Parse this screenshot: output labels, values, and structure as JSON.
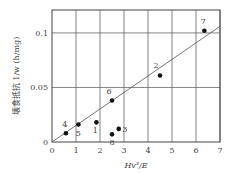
{
  "chart_data": {
    "type": "scatter",
    "title": "",
    "xlabel": "Hv³/E",
    "ylabel": "壊食抵抗  1/w (h/mg)",
    "xlim": [
      0,
      7
    ],
    "ylim": [
      0,
      0.121
    ],
    "x_ticks": [
      "0",
      "1",
      "2",
      "3",
      "4",
      "5",
      "6",
      "7"
    ],
    "y_ticks": [
      {
        "value": 0,
        "label": "0"
      },
      {
        "value": 0.05,
        "label": "0.05"
      },
      {
        "value": 0.1,
        "label": "0.1"
      }
    ],
    "grid": true,
    "points": [
      {
        "label": "1",
        "x": 1.85,
        "y": 0.018
      },
      {
        "label": "2",
        "x": 4.5,
        "y": 0.061
      },
      {
        "label": "3",
        "x": 2.78,
        "y": 0.012
      },
      {
        "label": "4",
        "x": 0.58,
        "y": 0.008
      },
      {
        "label": "5",
        "x": 1.1,
        "y": 0.016
      },
      {
        "label": "6",
        "x": 2.5,
        "y": 0.038
      },
      {
        "label": "7",
        "x": 6.35,
        "y": 0.102
      },
      {
        "label": "8",
        "x": 2.5,
        "y": 0.007
      }
    ],
    "fit_line": {
      "x": [
        0,
        7
      ],
      "y": [
        0,
        0.106
      ]
    },
    "point_label_offsets": {
      "1": [
        -1,
        11
      ],
      "2": [
        -4,
        -7
      ],
      "3": [
        6,
        3
      ],
      "4": [
        -1,
        -6
      ],
      "5": [
        0,
        11
      ],
      "6": [
        -3,
        -7
      ],
      "7": [
        -1,
        -7
      ],
      "8": [
        0,
        11
      ]
    }
  }
}
